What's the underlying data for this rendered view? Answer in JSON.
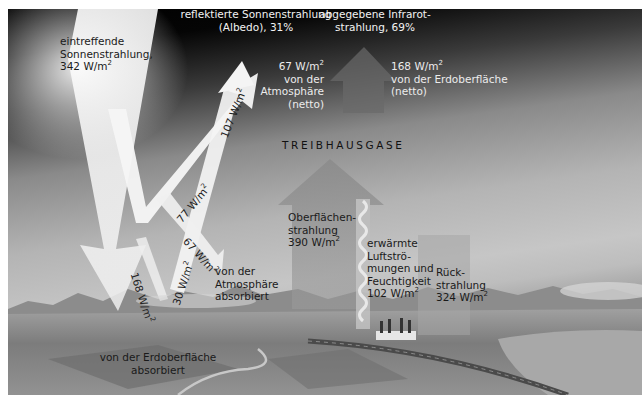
{
  "diagram": {
    "title": "TREIBHAUSGASE",
    "incoming": {
      "line1": "eintreffende",
      "line2": "Sonnenstrahlung,",
      "line3": "342 W/m",
      "sup": "2"
    },
    "reflected": {
      "line1": "reflektierte Sonnenstrahlung",
      "line2": "(Albedo), 31%"
    },
    "emitted_ir": {
      "line1": "abgegebene Infrarot-",
      "line2": "strahlung, 69%"
    },
    "atm_out": {
      "line1": "67 W/m",
      "sup": "2",
      "line2": "von der",
      "line3": "Atmosphäre",
      "line4": "(netto)"
    },
    "surf_out": {
      "line1": "168 W/m",
      "sup": "2",
      "line2": "von der Erdoberfläche",
      "line3": "(netto)"
    },
    "arrow_107": {
      "value": "107 W/m",
      "sup": "2"
    },
    "arrow_77": {
      "value": "77 W/m",
      "sup": "2"
    },
    "arrow_67": {
      "value": "67 W/m",
      "sup": "2"
    },
    "arrow_30": {
      "value": "30 W/m",
      "sup": "2"
    },
    "arrow_168": {
      "value": "168 W/m",
      "sup": "2"
    },
    "atm_absorbed": {
      "line1": "von der",
      "line2": "Atmosphäre",
      "line3": "absorbiert"
    },
    "surface_absorbed": {
      "line1": "von der Erdoberfläche",
      "line2": "absorbiert"
    },
    "surface_radiation": {
      "line1": "Oberflächen-",
      "line2": "strahlung",
      "line3": "390 W/m",
      "sup": "2"
    },
    "thermals": {
      "line1": "erwärmte",
      "line2": "Luftströ-",
      "line3": "mungen und",
      "line4": "Feuchtigkeit",
      "line5": "102 W/m",
      "sup": "2"
    },
    "back_radiation": {
      "line1": "Rück-",
      "line2": "strahlung",
      "line3": "324 W/m",
      "sup": "2"
    }
  },
  "colors": {
    "sky_top": "#000000",
    "sky_haze": "#c4c4c4",
    "solar_arrow": "#f4f4f4",
    "ir_arrow": "#8c8c8c",
    "ground": "#7a7a7a"
  }
}
